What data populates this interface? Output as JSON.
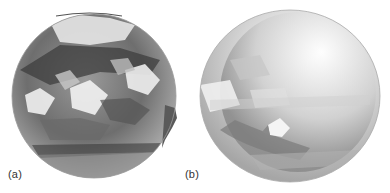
{
  "figure": {
    "panels": [
      {
        "id": "a",
        "label": "(a)",
        "description": "Semi-transparent sphere with patchy gray/white shaded mesh facets and inner head surface",
        "tone": "dark"
      },
      {
        "id": "b",
        "label": "(b)",
        "description": "Semi-transparent sphere enclosing a lighter rendered head surface (face with nose visible)",
        "tone": "light"
      }
    ],
    "colors": {
      "background": "#ffffff",
      "dark_shade": "#4a4a4a",
      "mid_shade": "#8a8a8a",
      "light_shade": "#e8e8e8",
      "label_text": "#333333"
    }
  }
}
